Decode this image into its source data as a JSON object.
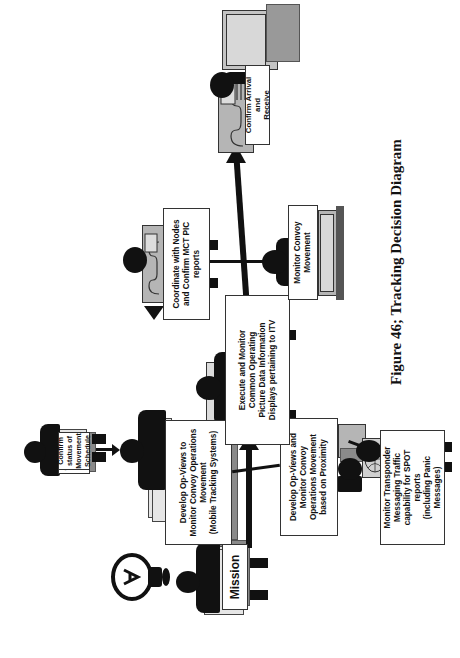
{
  "figure": {
    "caption": "Figure 46; Tracking Decision Diagram",
    "orientation": "rotated 90° counter-clockwise"
  },
  "nodes": {
    "mission": {
      "label": "Mission"
    },
    "confirm_status": {
      "lines": [
        "Confirm status of",
        "Movement Schedule"
      ]
    },
    "develop_mobile": {
      "lines": [
        "Develop Op-Views to",
        "Monitor Convoy Operations",
        "Movement",
        "(Mobile Tracking Systems)"
      ]
    },
    "develop_proximity": {
      "lines": [
        "Develop Op-Views and",
        "Monitor Convoy",
        "Operations Movement",
        "based on Proximity"
      ]
    },
    "monitor_transponder": {
      "lines": [
        "Monitor Transponder",
        "Messaging Traffic",
        "capability for SPOT reports",
        "(including Panic Messages)"
      ]
    },
    "execute_monitor": {
      "lines": [
        "Execute and Monitor",
        "Common Operating",
        "Picture Data Information",
        "Displays pertaining to ITV"
      ]
    },
    "coordinate_nodes": {
      "lines": [
        "Coordinate with Nodes",
        "and Confirm MCT PIC",
        "reports"
      ]
    },
    "monitor_convoy": {
      "lines": [
        "Monitor Convoy",
        "Movement"
      ]
    },
    "confirm_arrival": {
      "lines": [
        "Confirm Arrival and",
        "Receive"
      ]
    }
  },
  "icons": {
    "lightbulb": "lightbulb-icon",
    "person": "person-at-desk-icon",
    "computer": "computer-terminal-icon",
    "globe": "globe-icon",
    "phone": "telephone-icon"
  },
  "colors": {
    "ink": "#111111",
    "paper_light": "#e6e6e6",
    "paper_mid": "#bdbdbd",
    "paper_dark": "#8a8a8a",
    "terminal": "#b5b5b5"
  }
}
